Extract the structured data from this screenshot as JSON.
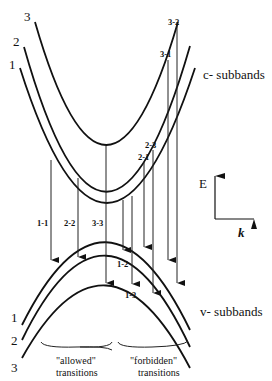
{
  "diagram": {
    "conduction_label": "c- subbands",
    "valence_label": "v- subbands",
    "axes": {
      "y_label": "E",
      "x_label": "k"
    },
    "conduction_bands": [
      {
        "id": "1",
        "label": "1"
      },
      {
        "id": "2",
        "label": "2"
      },
      {
        "id": "3",
        "label": "3"
      }
    ],
    "valence_bands": [
      {
        "id": "1",
        "label": "1"
      },
      {
        "id": "2",
        "label": "2"
      },
      {
        "id": "3",
        "label": "3"
      }
    ],
    "transitions": [
      {
        "label": "1-1",
        "type": "allowed"
      },
      {
        "label": "2-2",
        "type": "allowed"
      },
      {
        "label": "3-3",
        "type": "allowed"
      },
      {
        "label": "1-2",
        "type": "forbidden"
      },
      {
        "label": "1-3",
        "type": "forbidden"
      },
      {
        "label": "2-1",
        "type": "forbidden"
      },
      {
        "label": "2-3",
        "type": "forbidden"
      },
      {
        "label": "3-1",
        "type": "forbidden"
      },
      {
        "label": "3-2",
        "type": "forbidden"
      }
    ],
    "groups": {
      "allowed_line1": "\"allowed\"",
      "allowed_line2": "transitions",
      "forbidden_line1": "\"forbidden\"",
      "forbidden_line2": "transitions"
    }
  }
}
